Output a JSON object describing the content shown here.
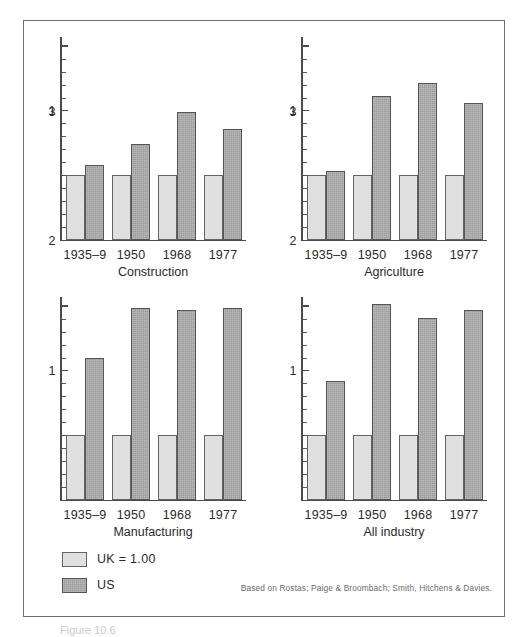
{
  "figure": {
    "caption": "Figure 10.6",
    "source_note": "Based on Rostas; Paige & Broombach; Smith, Hitchens & Davies."
  },
  "legend": {
    "items": [
      {
        "key": "uk",
        "label": "UK  =  1.00",
        "color": "#e0e0e0"
      },
      {
        "key": "us",
        "label": "US",
        "color": "#9b9b9b"
      }
    ]
  },
  "axis": {
    "y_major_ticks": [
      1,
      2,
      3
    ],
    "y_tick_labels": [
      "1",
      "2",
      "3"
    ],
    "y_minor_step": 0.2,
    "ylim": [
      0,
      3.15
    ]
  },
  "chart_data": {
    "type": "bar",
    "title": "",
    "xlabel": "",
    "ylabel": "",
    "ylim": [
      0,
      3.15
    ],
    "grid": false,
    "legend_position": "bottom-left",
    "categories": [
      "1935-9",
      "1950",
      "1968",
      "1977"
    ],
    "series_names": [
      "UK = 1.00",
      "US"
    ],
    "panels": [
      {
        "name": "Construction",
        "categories": [
          "1935-9",
          "1950",
          "1968",
          "1977"
        ],
        "series": [
          {
            "name": "UK = 1.00",
            "values": [
              1.0,
              1.0,
              1.0,
              1.0
            ]
          },
          {
            "name": "US",
            "values": [
              1.15,
              1.48,
              1.97,
              1.71
            ]
          }
        ]
      },
      {
        "name": "Agriculture",
        "categories": [
          "1935-9",
          "1950",
          "1968",
          "1977"
        ],
        "series": [
          {
            "name": "UK = 1.00",
            "values": [
              1.0,
              1.0,
              1.0,
              1.0
            ]
          },
          {
            "name": "US",
            "values": [
              1.06,
              2.22,
              2.42,
              2.11
            ]
          }
        ]
      },
      {
        "name": "Manufacturing",
        "categories": [
          "1935-9",
          "1950",
          "1968",
          "1977"
        ],
        "series": [
          {
            "name": "UK = 1.00",
            "values": [
              1.0,
              1.0,
              1.0,
              1.0
            ]
          },
          {
            "name": "US",
            "values": [
              2.18,
              2.96,
              2.92,
              2.95
            ]
          }
        ]
      },
      {
        "name": "All industry",
        "categories": [
          "1935-9",
          "1950",
          "1968",
          "1977"
        ],
        "series": [
          {
            "name": "UK = 1.00",
            "values": [
              1.0,
              1.0,
              1.0,
              1.0
            ]
          },
          {
            "name": "US",
            "values": [
              1.83,
              3.02,
              2.81,
              2.93
            ]
          }
        ]
      }
    ]
  }
}
